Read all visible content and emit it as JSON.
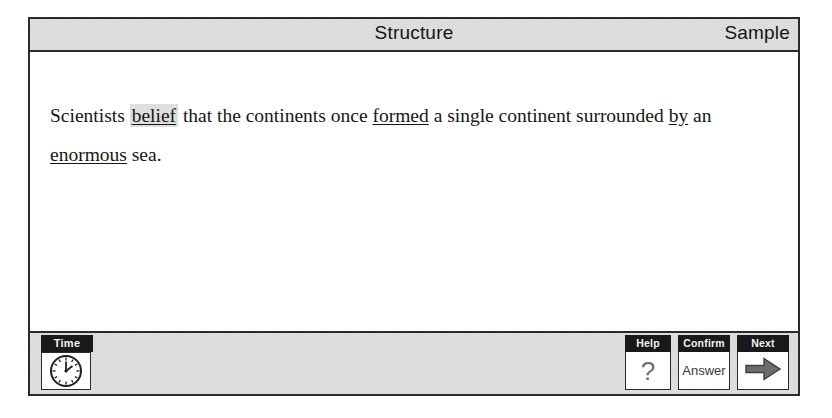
{
  "header": {
    "title": "Structure",
    "right_label": "Sample"
  },
  "passage": {
    "segments": [
      {
        "text": "Scientists ",
        "style": "plain"
      },
      {
        "text": "belief",
        "style": "highlight"
      },
      {
        "text": " that the continents once ",
        "style": "plain"
      },
      {
        "text": "formed",
        "style": "underline"
      },
      {
        "text": " a single continent surrounded ",
        "style": "plain"
      },
      {
        "text": "by",
        "style": "underline"
      },
      {
        "text": " an ",
        "style": "plain"
      },
      {
        "text": "enormous",
        "style": "underline"
      },
      {
        "text": " sea.",
        "style": "plain"
      }
    ],
    "full_text": "Scientists belief that the continents once formed a single continent surrounded by an enormous sea."
  },
  "toolbar": {
    "time": {
      "label": "Time",
      "icon": "analog-clock-icon"
    },
    "buttons": [
      {
        "caption": "Help",
        "glyph": "?",
        "icon": "question-mark-icon",
        "kind": "glyph"
      },
      {
        "caption": "Confirm",
        "glyph": "Answer",
        "icon": "answer-text",
        "kind": "text"
      },
      {
        "caption": "Next",
        "glyph": "→",
        "icon": "right-arrow-icon",
        "kind": "arrow"
      }
    ]
  },
  "colors": {
    "frame": "#2b2b2b",
    "chrome_gray": "#e3e3e3",
    "caption_bg": "#191919",
    "caption_fg": "#f2f2f2",
    "highlight": "#dedede",
    "arrow": "#6d6d6d",
    "page_bg": "#ffffff"
  }
}
